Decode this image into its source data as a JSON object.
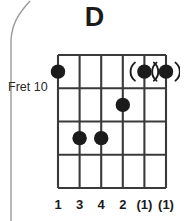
{
  "diagram": {
    "type": "guitar-chord-diagram",
    "title": "D",
    "fret_position_label": "Fret 10",
    "strings_count": 6,
    "frets_count": 4,
    "colors": {
      "ink": "#1b1b1b",
      "grid": "#3a3a3a",
      "background": "#ffffff",
      "edge_curve": "#9a9a9a"
    },
    "dots": [
      {
        "string": 1,
        "fret": 1,
        "optional": false
      },
      {
        "string": 5,
        "fret": 1,
        "optional": true
      },
      {
        "string": 6,
        "fret": 1,
        "optional": true
      },
      {
        "string": 4,
        "fret": 2,
        "optional": false
      },
      {
        "string": 2,
        "fret": 3,
        "optional": false
      },
      {
        "string": 3,
        "fret": 3,
        "optional": false
      }
    ],
    "finger_numbers": [
      {
        "string": 1,
        "label": "1"
      },
      {
        "string": 2,
        "label": "3"
      },
      {
        "string": 3,
        "label": "4"
      },
      {
        "string": 4,
        "label": "2"
      },
      {
        "string": 5,
        "label": "(1)"
      },
      {
        "string": 6,
        "label": "(1)"
      }
    ]
  }
}
